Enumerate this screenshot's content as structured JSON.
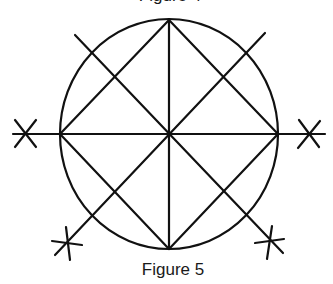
{
  "figure": {
    "top_caption": "Figure 4",
    "bottom_caption": "Figure 5",
    "stroke_color": "#111111",
    "background_color": "#ffffff",
    "elements": {
      "circle": {
        "cx": 169,
        "cy": 134,
        "rx": 109,
        "ry": 115
      },
      "center": [
        169,
        134
      ],
      "diamond_vertices": [
        [
          169,
          20
        ],
        [
          278,
          134
        ],
        [
          169,
          249
        ],
        [
          60,
          134
        ]
      ],
      "horizontal_axis": [
        [
          13,
          134
        ],
        [
          325,
          134
        ]
      ],
      "vertical_axis": [
        [
          169,
          20
        ],
        [
          169,
          249
        ]
      ],
      "diagonal_1": [
        [
          75,
          35
        ],
        [
          283,
          253
        ]
      ],
      "diagonal_2": [
        [
          265,
          33
        ],
        [
          55,
          255
        ]
      ],
      "marks": [
        {
          "name": "left-x-mark",
          "center": [
            25,
            134
          ],
          "type": "x"
        },
        {
          "name": "right-x-mark",
          "center": [
            310,
            134
          ],
          "type": "x"
        },
        {
          "name": "bottom-left-star-mark",
          "center": [
            67,
            243
          ],
          "type": "asterisk"
        },
        {
          "name": "bottom-right-star-mark",
          "center": [
            270,
            241
          ],
          "type": "asterisk"
        }
      ]
    }
  }
}
